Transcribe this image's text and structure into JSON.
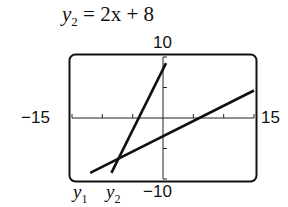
{
  "title": {
    "var": "y",
    "sub": "2",
    "rhs": " = 2x + 8"
  },
  "labels": {
    "ymax": "10",
    "ymin": "−10",
    "xmin": "−15",
    "xmax": "15",
    "y1_var": "y",
    "y1_sub": "1",
    "y2_var": "y",
    "y2_sub": "2"
  },
  "chart_data": {
    "type": "line",
    "title": "y2 = 2x + 8",
    "xlabel": "",
    "ylabel": "",
    "xlim": [
      -15,
      15
    ],
    "ylim": [
      -10,
      10
    ],
    "xticks": [
      -10,
      -5,
      0,
      5,
      10
    ],
    "yticks": [
      -5,
      0,
      5
    ],
    "grid": false,
    "legend": "labels below plot: y1, y2",
    "series": [
      {
        "name": "y1",
        "x": [
          -12,
          15
        ],
        "y": [
          -9,
          4.5
        ],
        "equation": "y1 = 0.5x - 3 (estimated)"
      },
      {
        "name": "y2",
        "x": [
          -8.5,
          0.5
        ],
        "y": [
          -9,
          9
        ],
        "equation": "y2 = 2x + 8"
      }
    ],
    "annotations": [
      "10",
      "-10",
      "-15",
      "15",
      "y1",
      "y2"
    ]
  }
}
